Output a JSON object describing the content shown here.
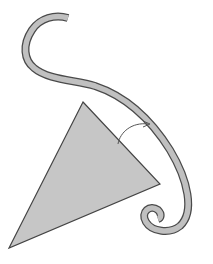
{
  "diagram": {
    "title": "",
    "shapes": [
      {
        "type": "curved-band",
        "name": "s-curve-band",
        "fill": "#c0c0c0",
        "stroke": "#555555"
      },
      {
        "type": "triangle",
        "name": "triangle",
        "fill": "#c6c6c6",
        "stroke": "#444444",
        "vertices": [
          [
            83,
            102
          ],
          [
            160,
            184
          ],
          [
            9,
            248
          ]
        ]
      },
      {
        "type": "arc-arrow",
        "name": "rotation-arrow",
        "stroke": "#555555"
      }
    ],
    "colors": {
      "background": "#ffffff",
      "shape_fill": "#c4c4c4",
      "outline": "#4a4a4a"
    }
  }
}
